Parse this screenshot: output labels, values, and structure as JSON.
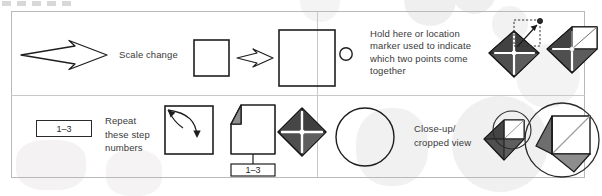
{
  "document": {
    "type": "legend-key",
    "title": "Symbol key / legend"
  },
  "legend": {
    "rows": 2,
    "columns": 2,
    "entries": [
      {
        "id": "scale-change",
        "position": "top-left",
        "label": "Scale change",
        "symbols": [
          "open-block-arrow",
          "small-square",
          "small-block-arrow",
          "large-square"
        ]
      },
      {
        "id": "hold-here-marker",
        "position": "top-right",
        "label": "Hold here or location marker used to indicate which two points come together",
        "label_lines": [
          "Hold here or location",
          "marker used to indicate",
          "which two points come",
          "together"
        ],
        "symbols": [
          "open-circle-marker",
          "diamond-with-dashed-arrow",
          "diamond-folded"
        ]
      },
      {
        "id": "repeat-step-numbers",
        "position": "bottom-left",
        "label": "Repeat these step numbers",
        "label_lines": [
          "Repeat",
          "these step",
          "numbers"
        ],
        "step_range": "1–3",
        "symbols": [
          "boxed-step-range",
          "square-with-curved-arrow",
          "page-with-folded-corner",
          "dark-diamond"
        ]
      },
      {
        "id": "close-up-cropped-view",
        "position": "bottom-right",
        "label": "Close-up/ cropped view",
        "label_lines": [
          "Close-up/",
          "cropped view"
        ],
        "symbols": [
          "open-circle",
          "diamond-with-small-circle",
          "magnified-crop-circle"
        ]
      }
    ]
  },
  "colors": {
    "ink": "#1e1e1e",
    "text": "#3a3a3a",
    "frame": "#b9b9b9",
    "divider": "#c9c9c9",
    "fill_dark": "#4d4d4d",
    "fill_mid": "#7d7d7d",
    "fill_light": "#bdbdbd",
    "background": "#ffffff"
  }
}
